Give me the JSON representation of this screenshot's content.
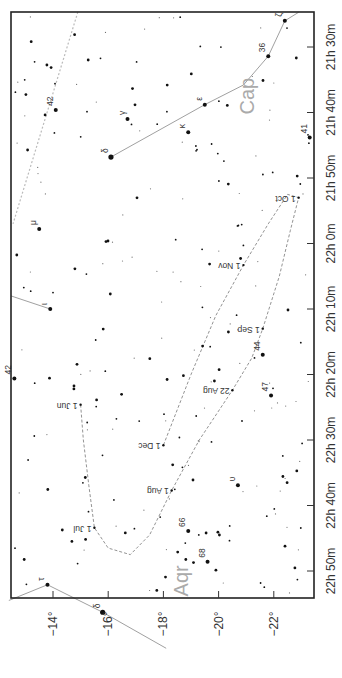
{
  "chart_data": {
    "type": "scatter",
    "title": "",
    "orientation": "rotated 90 degrees clockwise (RA along right edge, Dec along bottom edge)",
    "xlabel": "Declination",
    "ylabel": "Right Ascension",
    "dec_range": [
      -12.4,
      -23.3
    ],
    "ra_range_minutes_from_21h": [
      24.6,
      113.9
    ],
    "dec_ticks": [
      {
        "value": -14,
        "label": "−14°"
      },
      {
        "value": -16,
        "label": "−16°"
      },
      {
        "value": -18,
        "label": "−18°"
      },
      {
        "value": -20,
        "label": "−20°"
      },
      {
        "value": -22,
        "label": "−22°"
      }
    ],
    "ra_ticks": [
      {
        "value": 30,
        "label": "21h 30m"
      },
      {
        "value": 40,
        "label": "21h 40m"
      },
      {
        "value": 50,
        "label": "21h 50m"
      },
      {
        "value": 60,
        "label": "22h 0m"
      },
      {
        "value": 70,
        "label": "22h 10m"
      },
      {
        "value": 80,
        "label": "22h 20m"
      },
      {
        "value": 90,
        "label": "22h 30m"
      },
      {
        "value": 100,
        "label": "22h 40m"
      },
      {
        "value": 110,
        "label": "22h 50m"
      }
    ],
    "constellations": [
      {
        "name": "Cap",
        "dec": -21.3,
        "ra": 37.5
      },
      {
        "name": "Aqr",
        "dec": -18.9,
        "ra": 111.5
      }
    ],
    "named_stars": [
      {
        "label": "ζ",
        "dec": -22.4,
        "ra": 26.0,
        "mag": 2
      },
      {
        "label": "36",
        "dec": -21.8,
        "ra": 31.4,
        "mag": 2
      },
      {
        "label": "ε",
        "dec": -19.5,
        "ra": 38.8,
        "mag": 2
      },
      {
        "label": "γ",
        "dec": -16.7,
        "ra": 41.0,
        "mag": 2
      },
      {
        "label": "κ",
        "dec": -18.9,
        "ra": 43.0,
        "mag": 2
      },
      {
        "label": "δ",
        "dec": -16.1,
        "ra": 46.8,
        "mag": 1
      },
      {
        "label": "42",
        "dec": -14.1,
        "ra": 39.6,
        "mag": 2
      },
      {
        "label": "41",
        "dec": -23.3,
        "ra": 43.8,
        "mag": 2
      },
      {
        "label": "μ",
        "dec": -13.5,
        "ra": 57.8,
        "mag": 2
      },
      {
        "label": "ι",
        "dec": -13.9,
        "ra": 70.0,
        "mag": 2
      },
      {
        "label": "42",
        "dec": -12.6,
        "ra": 80.6,
        "mag": 2
      },
      {
        "label": "44",
        "dec": -21.6,
        "ra": 77.0,
        "mag": 2
      },
      {
        "label": "47",
        "dec": -21.9,
        "ra": 83.2,
        "mag": 2
      },
      {
        "label": "υ",
        "dec": -20.7,
        "ra": 96.9,
        "mag": 2
      },
      {
        "label": "66",
        "dec": -18.9,
        "ra": 103.9,
        "mag": 2
      },
      {
        "label": "68",
        "dec": -19.6,
        "ra": 108.6,
        "mag": 2
      },
      {
        "label": "τ",
        "dec": -13.8,
        "ra": 112.1,
        "mag": 2
      },
      {
        "label": "δ",
        "dec": -15.8,
        "ra": 116.3,
        "mag": 1
      }
    ],
    "path": {
      "style": "dashed",
      "dates": [
        {
          "label": "1 Jun",
          "dec": -15.0,
          "ra": 84.6
        },
        {
          "label": "1 Jul",
          "dec": -15.5,
          "ra": 103.4
        },
        {
          "label": "1 Aug",
          "dec": -18.3,
          "ra": 97.7
        },
        {
          "label": "22 Aug",
          "dec": -20.5,
          "ra": 82.4
        },
        {
          "label": "1 Sep",
          "dec": -21.6,
          "ra": 73.0
        },
        {
          "label": "1 Oct",
          "dec": -22.9,
          "ra": 53.0
        },
        {
          "label": "1 Nov",
          "dec": -20.9,
          "ra": 63.3
        },
        {
          "label": "1 Dec",
          "dec": -18.0,
          "ra": 90.8
        }
      ]
    },
    "grid": false,
    "legend": "none"
  }
}
